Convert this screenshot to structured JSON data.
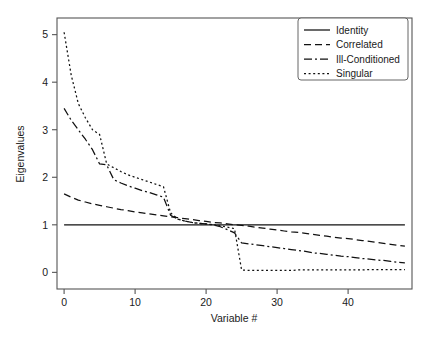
{
  "chart_data": {
    "type": "line",
    "title": "",
    "xlabel": "Variable #",
    "ylabel": "Eigenvalues",
    "xlim": [
      -1,
      49
    ],
    "ylim": [
      -0.35,
      5.35
    ],
    "xticks": [
      0,
      10,
      20,
      30,
      40
    ],
    "yticks": [
      0,
      1,
      2,
      3,
      4,
      5
    ],
    "xticklabels": [
      "0",
      "10",
      "20",
      "30",
      "40"
    ],
    "yticklabels": [
      "0",
      "1",
      "2",
      "3",
      "4",
      "5"
    ],
    "grid": false,
    "legend_position": "upper right",
    "x": [
      0,
      1,
      2,
      3,
      4,
      5,
      6,
      7,
      8,
      9,
      10,
      11,
      12,
      13,
      14,
      15,
      16,
      17,
      18,
      19,
      20,
      21,
      22,
      23,
      24,
      25,
      26,
      27,
      28,
      29,
      30,
      31,
      32,
      33,
      34,
      35,
      36,
      37,
      38,
      39,
      40,
      41,
      42,
      43,
      44,
      45,
      46,
      47,
      48
    ],
    "series": [
      {
        "name": "Identity",
        "style": "solid",
        "values": [
          1.0,
          1.0,
          1.0,
          1.0,
          1.0,
          1.0,
          1.0,
          1.0,
          1.0,
          1.0,
          1.0,
          1.0,
          1.0,
          1.0,
          1.0,
          1.0,
          1.0,
          1.0,
          1.0,
          1.0,
          1.0,
          1.0,
          1.0,
          1.0,
          1.0,
          1.0,
          1.0,
          1.0,
          1.0,
          1.0,
          1.0,
          1.0,
          1.0,
          1.0,
          1.0,
          1.0,
          1.0,
          1.0,
          1.0,
          1.0,
          1.0,
          1.0,
          1.0,
          1.0,
          1.0,
          1.0,
          1.0,
          1.0,
          1.0
        ]
      },
      {
        "name": "Correlated",
        "style": "dashed",
        "values": [
          1.65,
          1.58,
          1.52,
          1.48,
          1.44,
          1.41,
          1.38,
          1.35,
          1.32,
          1.3,
          1.27,
          1.25,
          1.23,
          1.21,
          1.19,
          1.17,
          1.15,
          1.13,
          1.11,
          1.09,
          1.07,
          1.05,
          1.04,
          1.02,
          1.0,
          0.99,
          0.97,
          0.95,
          0.93,
          0.91,
          0.89,
          0.87,
          0.85,
          0.84,
          0.82,
          0.8,
          0.78,
          0.76,
          0.74,
          0.72,
          0.71,
          0.69,
          0.67,
          0.65,
          0.63,
          0.61,
          0.59,
          0.57,
          0.55
        ]
      },
      {
        "name": "Ill-Conditioned",
        "style": "dashdot",
        "values": [
          3.45,
          3.2,
          3.0,
          2.8,
          2.58,
          2.28,
          2.26,
          1.95,
          1.88,
          1.82,
          1.77,
          1.72,
          1.68,
          1.63,
          1.58,
          1.2,
          1.12,
          1.08,
          1.05,
          1.03,
          1.02,
          1.0,
          0.96,
          0.9,
          0.83,
          0.62,
          0.6,
          0.58,
          0.56,
          0.54,
          0.52,
          0.5,
          0.48,
          0.46,
          0.44,
          0.41,
          0.4,
          0.38,
          0.36,
          0.34,
          0.33,
          0.31,
          0.29,
          0.28,
          0.26,
          0.25,
          0.23,
          0.21,
          0.2
        ]
      },
      {
        "name": "Singular",
        "style": "dotted",
        "values": [
          5.05,
          4.15,
          3.55,
          3.25,
          3.0,
          2.9,
          2.28,
          2.2,
          2.12,
          2.05,
          2.0,
          1.95,
          1.9,
          1.85,
          1.8,
          1.25,
          1.12,
          1.08,
          1.05,
          1.03,
          1.02,
          1.0,
          0.98,
          0.95,
          0.92,
          0.05,
          0.04,
          0.04,
          0.04,
          0.04,
          0.04,
          0.04,
          0.04,
          0.05,
          0.05,
          0.05,
          0.05,
          0.05,
          0.05,
          0.05,
          0.05,
          0.05,
          0.05,
          0.06,
          0.06,
          0.06,
          0.06,
          0.06,
          0.06
        ]
      }
    ],
    "legend": [
      {
        "label": "Identity",
        "style": "solid"
      },
      {
        "label": "Correlated",
        "style": "dashed"
      },
      {
        "label": "Ill-Conditioned",
        "style": "dashdot"
      },
      {
        "label": "Singular",
        "style": "dotted"
      }
    ],
    "colors": {
      "line": "#111111",
      "axis": "#555555",
      "background": "#ffffff"
    }
  }
}
